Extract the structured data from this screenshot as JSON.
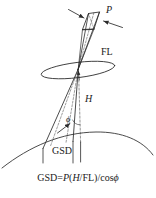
{
  "figure": {
    "kind": "technical-line-diagram",
    "background_color": "#ffffff",
    "line_color": "#2b2b2b",
    "text_color": "#1a1a1a"
  },
  "labels": {
    "pixel_size": "P",
    "focal_length": "FL",
    "altitude": "H",
    "off_nadir_angle": "ϕ",
    "ground_sample_distance": "GSD"
  },
  "formula": {
    "lhs": "GSD",
    "equals": "=",
    "p": "P",
    "open_paren": "(",
    "h": "H",
    "slash": "/",
    "fl": "FL",
    "close_paren": ")",
    "divide": "/",
    "cos": "cos",
    "phi": "ϕ",
    "full_text": "GSD=P(H/FL)/cosϕ"
  },
  "elements": {
    "sensor_patch": "sensor-pixel-parallelogram",
    "lens_ellipse": "lens-aperture-ellipse",
    "upper_cone": "focal-length-ray-cone",
    "lower_cone": "ground-projection-ray-cone",
    "nadir_line": "altitude-dashed-line",
    "center_ray": "center-ray-dashed-line",
    "earth_arc": "earth-surface-arc",
    "gsd_ticks": "gsd-extent-tick-marks",
    "p_arrows": "pixel-width-arrow-pair",
    "phi_arc": "off-nadir-angle-arc",
    "phi_arrow": "off-nadir-angle-leader-arrow"
  }
}
